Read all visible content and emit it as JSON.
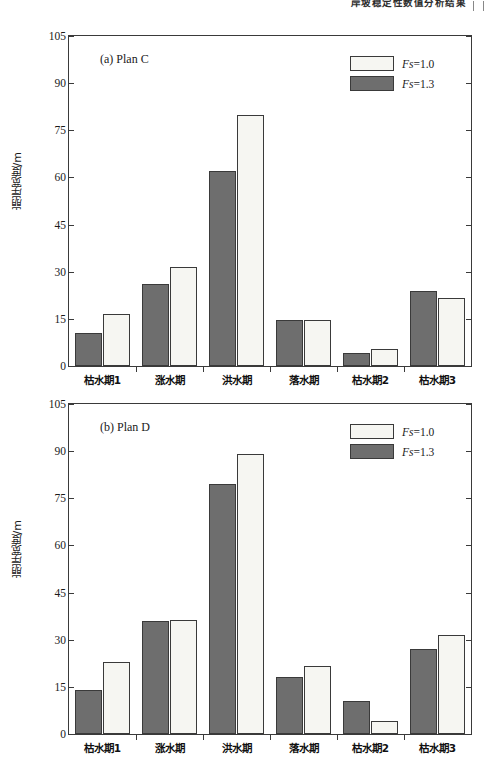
{
  "header": {
    "running_text": "岸坡稳定性数值分析结果",
    "rule_icon": "page-edge-rule"
  },
  "chart_data": [
    {
      "type": "bar",
      "panel_id": "a",
      "title": "(a) Plan C",
      "xlabel": "",
      "ylabel": "崩岸宽度/m",
      "categories": [
        "枯水期1",
        "涨水期",
        "洪水期",
        "落水期",
        "枯水期2",
        "枯水期3"
      ],
      "series": [
        {
          "name": "Fs=1.3",
          "color": "#6e6e6e",
          "values": [
            10.5,
            26.0,
            62.0,
            14.5,
            4.0,
            24.0
          ]
        },
        {
          "name": "Fs=1.0",
          "color": "#f6f6f2",
          "values": [
            16.5,
            31.5,
            80.0,
            14.8,
            5.5,
            21.5
          ]
        }
      ],
      "ylim": [
        0,
        105
      ],
      "yticks": [
        0,
        15,
        30,
        45,
        60,
        75,
        90,
        105
      ],
      "grid": false,
      "legend_position": "top-right"
    },
    {
      "type": "bar",
      "panel_id": "b",
      "title": "(b) Plan D",
      "xlabel": "",
      "ylabel": "崩岸宽度/m",
      "categories": [
        "枯水期1",
        "涨水期",
        "洪水期",
        "落水期",
        "枯水期2",
        "枯水期3"
      ],
      "series": [
        {
          "name": "Fs=1.3",
          "color": "#6e6e6e",
          "values": [
            14.0,
            36.0,
            79.5,
            18.0,
            10.5,
            27.0
          ]
        },
        {
          "name": "Fs=1.0",
          "color": "#f6f6f2",
          "values": [
            23.0,
            36.2,
            89.0,
            21.5,
            4.0,
            31.5
          ]
        }
      ],
      "ylim": [
        0,
        105
      ],
      "yticks": [
        0,
        15,
        30,
        45,
        60,
        75,
        90,
        105
      ],
      "grid": false,
      "legend_position": "top-right"
    }
  ],
  "legend": {
    "entries": [
      {
        "symbol": "Fs",
        "relation": "=1.0",
        "fill": "light"
      },
      {
        "symbol": "Fs",
        "relation": "=1.3",
        "fill": "dark"
      }
    ]
  }
}
